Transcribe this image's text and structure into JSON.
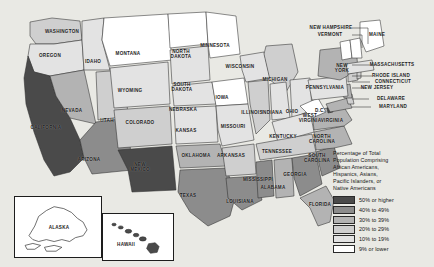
{
  "map": {
    "title": "United States minority population choropleth map",
    "background_color": "#e9e9e4",
    "border_color": "#1d1d1d"
  },
  "legend": {
    "title": "Percentage of Total\nPopulation Comprising\nAfrican Americans,\nHispanics, Asians,\nPacific Islanders, or\nNative Americans",
    "entries": [
      {
        "label": "50% or higher",
        "color": "#4a4a4a"
      },
      {
        "label": "40% to 49%",
        "color": "#8c8c8c"
      },
      {
        "label": "30% to 39%",
        "color": "#b3b3b3"
      },
      {
        "label": "20% to 29%",
        "color": "#cfcfcf"
      },
      {
        "label": "10% to 19%",
        "color": "#e3e3e3"
      },
      {
        "label": "9% or lower",
        "color": "#ffffff"
      }
    ]
  },
  "insets": {
    "alaska": {
      "label": "ALASKA",
      "fill": "#ffffff"
    },
    "hawaii": {
      "label": "HAWAII",
      "fill": "#4a4a4a"
    }
  },
  "chart_data": {
    "type": "choropleth",
    "title": "Percentage of Total Population Comprising African Americans, Hispanics, Asians, Pacific Islanders, or Native Americans",
    "bins": [
      {
        "label": "50% or higher",
        "color": "#4a4a4a"
      },
      {
        "label": "40% to 49%",
        "color": "#8c8c8c"
      },
      {
        "label": "30% to 39%",
        "color": "#b3b3b3"
      },
      {
        "label": "20% to 29%",
        "color": "#cfcfcf"
      },
      {
        "label": "10% to 19%",
        "color": "#e3e3e3"
      },
      {
        "label": "9% or lower",
        "color": "#ffffff"
      }
    ],
    "legend_position": "right",
    "states": [
      {
        "code": "WA",
        "name": "WASHINGTON",
        "bin": "20% to 29%",
        "color": "#cfcfcf",
        "label_x": 62,
        "label_y": 32,
        "label": "WASHINGTON"
      },
      {
        "code": "OR",
        "name": "OREGON",
        "bin": "10% to 19%",
        "color": "#e3e3e3",
        "label_x": 50,
        "label_y": 56,
        "label": "OREGON"
      },
      {
        "code": "ID",
        "name": "IDAHO",
        "bin": "10% to 19%",
        "color": "#e3e3e3",
        "label_x": 93,
        "label_y": 62,
        "label": "IDAHO"
      },
      {
        "code": "CA",
        "name": "CALIFORNIA",
        "bin": "50% or higher",
        "color": "#4a4a4a",
        "label_x": 46,
        "label_y": 128,
        "label": "CALIFORNIA"
      },
      {
        "code": "NV",
        "name": "NEVADA",
        "bin": "30% to 39%",
        "color": "#b3b3b3",
        "label_x": 72,
        "label_y": 111,
        "label": "NEVADA"
      },
      {
        "code": "UT",
        "name": "UTAH",
        "bin": "20% to 29%",
        "color": "#cfcfcf",
        "label_x": 107,
        "label_y": 121,
        "label": "UTAH"
      },
      {
        "code": "AZ",
        "name": "ARIZONA",
        "bin": "40% to 49%",
        "color": "#8c8c8c",
        "label_x": 89,
        "label_y": 160,
        "label": "ARIZONA"
      },
      {
        "code": "MT",
        "name": "MONTANA",
        "bin": "9% or lower",
        "color": "#ffffff",
        "label_x": 128,
        "label_y": 54,
        "label": "MONTANA"
      },
      {
        "code": "WY",
        "name": "WYOMING",
        "bin": "10% to 19%",
        "color": "#e3e3e3",
        "label_x": 130,
        "label_y": 91,
        "label": "WYOMING"
      },
      {
        "code": "CO",
        "name": "COLORADO",
        "bin": "20% to 29%",
        "color": "#cfcfcf",
        "label_x": 140,
        "label_y": 123,
        "label": "COLORADO"
      },
      {
        "code": "NM",
        "name": "NEW\nMEXICO",
        "bin": "50% or higher",
        "color": "#4a4a4a",
        "label_x": 140,
        "label_y": 167,
        "label": "NEW\nMEXICO"
      },
      {
        "code": "ND",
        "name": "NORTH\nDAKOTA",
        "bin": "9% or lower",
        "color": "#ffffff",
        "label_x": 181,
        "label_y": 54,
        "label": "NORTH\nDAKOTA"
      },
      {
        "code": "SD",
        "name": "SOUTH\nDAKOTA",
        "bin": "10% to 19%",
        "color": "#e3e3e3",
        "label_x": 182,
        "label_y": 87,
        "label": "SOUTH\nDAKOTA"
      },
      {
        "code": "NE",
        "name": "NEBRASKA",
        "bin": "10% to 19%",
        "color": "#e3e3e3",
        "label_x": 183,
        "label_y": 110,
        "label": "NEBRASKA"
      },
      {
        "code": "KS",
        "name": "KANSAS",
        "bin": "10% to 19%",
        "color": "#e3e3e3",
        "label_x": 186,
        "label_y": 131,
        "label": "KANSAS"
      },
      {
        "code": "OK",
        "name": "OKLAHOMA",
        "bin": "30% to 39%",
        "color": "#b3b3b3",
        "label_x": 196,
        "label_y": 156,
        "label": "OKLAHOMA"
      },
      {
        "code": "TX",
        "name": "TEXAS",
        "bin": "40% to 49%",
        "color": "#8c8c8c",
        "label_x": 188,
        "label_y": 196,
        "label": "TEXAS"
      },
      {
        "code": "MN",
        "name": "MINNESOTA",
        "bin": "9% or lower",
        "color": "#ffffff",
        "label_x": 215,
        "label_y": 46,
        "label": "MINNESOTA"
      },
      {
        "code": "IA",
        "name": "IOWA",
        "bin": "9% or lower",
        "color": "#ffffff",
        "label_x": 222,
        "label_y": 98,
        "label": "IOWA"
      },
      {
        "code": "MO",
        "name": "MISSOURI",
        "bin": "10% to 19%",
        "color": "#e3e3e3",
        "label_x": 233,
        "label_y": 127,
        "label": "MISSOURI"
      },
      {
        "code": "AR",
        "name": "ARKANSAS",
        "bin": "20% to 29%",
        "color": "#cfcfcf",
        "label_x": 231,
        "label_y": 156,
        "label": "ARKANSAS"
      },
      {
        "code": "LA",
        "name": "LOUISIANA",
        "bin": "40% to 49%",
        "color": "#8c8c8c",
        "label_x": 240,
        "label_y": 202,
        "label": "LOUISIANA"
      },
      {
        "code": "WI",
        "name": "WISCONSIN",
        "bin": "10% to 19%",
        "color": "#e3e3e3",
        "label_x": 240,
        "label_y": 67,
        "label": "WISCONSIN"
      },
      {
        "code": "IL",
        "name": "ILLINOIS",
        "bin": "20% to 29%",
        "color": "#cfcfcf",
        "label_x": 252,
        "label_y": 113,
        "label": "ILLINOIS"
      },
      {
        "code": "MI",
        "name": "MICHIGAN",
        "bin": "20% to 29%",
        "color": "#cfcfcf",
        "label_x": 275,
        "label_y": 80,
        "label": "MICHIGAN"
      },
      {
        "code": "IN",
        "name": "INDIANA",
        "bin": "10% to 19%",
        "color": "#e3e3e3",
        "label_x": 272,
        "label_y": 113,
        "label": "INDIANA"
      },
      {
        "code": "OH",
        "name": "OHIO",
        "bin": "10% to 19%",
        "color": "#e3e3e3",
        "label_x": 292,
        "label_y": 112,
        "label": "OHIO"
      },
      {
        "code": "KY",
        "name": "KENTUCKY",
        "bin": "10% to 19%",
        "color": "#e3e3e3",
        "label_x": 283,
        "label_y": 137,
        "label": "KENTUCKY"
      },
      {
        "code": "TN",
        "name": "TENNESSEE",
        "bin": "20% to 29%",
        "color": "#cfcfcf",
        "label_x": 277,
        "label_y": 152,
        "label": "TENNESSEE"
      },
      {
        "code": "MS",
        "name": "MISSISSIPPI",
        "bin": "40% to 49%",
        "color": "#8c8c8c",
        "label_x": 258,
        "label_y": 180,
        "label": "MISSISSIPPI"
      },
      {
        "code": "AL",
        "name": "ALABAMA",
        "bin": "30% to 39%",
        "color": "#b3b3b3",
        "label_x": 273,
        "label_y": 188,
        "label": "ALABAMA"
      },
      {
        "code": "GA",
        "name": "GEORGIA",
        "bin": "40% to 49%",
        "color": "#8c8c8c",
        "label_x": 295,
        "label_y": 175,
        "label": "GEORGIA"
      },
      {
        "code": "FL",
        "name": "FLORIDA",
        "bin": "30% to 39%",
        "color": "#b3b3b3",
        "label_x": 320,
        "label_y": 205,
        "label": "FLORIDA"
      },
      {
        "code": "SC",
        "name": "SOUTH\nCAROLINA",
        "bin": "40% to 49%",
        "color": "#8c8c8c",
        "label_x": 317,
        "label_y": 158,
        "label": "SOUTH\nCAROLINA"
      },
      {
        "code": "NC",
        "name": "NORTH\nCAROLINA",
        "bin": "30% to 39%",
        "color": "#b3b3b3",
        "label_x": 322,
        "label_y": 139,
        "label": "NORTH\nCAROLINA"
      },
      {
        "code": "VA",
        "name": "VIRGINIA",
        "bin": "30% to 39%",
        "color": "#b3b3b3",
        "label_x": 332,
        "label_y": 121,
        "label": "VIRGINIA"
      },
      {
        "code": "WV",
        "name": "WEST\nVIRGINIA",
        "bin": "9% or lower",
        "color": "#ffffff",
        "label_x": 310,
        "label_y": 118,
        "label": "WEST\nVIRGINIA"
      },
      {
        "code": "DC",
        "name": "D.C.",
        "bin": "50% or higher",
        "color": "#4a4a4a",
        "label_x": 320,
        "label_y": 111,
        "label": "D.C."
      },
      {
        "code": "MD",
        "name": "MARYLAND",
        "bin": "30% to 39%",
        "color": "#b3b3b3",
        "label_x": 393,
        "label_y": 107,
        "label": "MARYLAND"
      },
      {
        "code": "DE",
        "name": "DELAWARE",
        "bin": "20% to 29%",
        "color": "#cfcfcf",
        "label_x": 391,
        "label_y": 99,
        "label": "DELAWARE"
      },
      {
        "code": "NJ",
        "name": "NEW JERSEY",
        "bin": "30% to 39%",
        "color": "#b3b3b3",
        "label_x": 377,
        "label_y": 88,
        "label": "NEW JERSEY"
      },
      {
        "code": "PA",
        "name": "PENNSYLVANIA",
        "bin": "10% to 19%",
        "color": "#e3e3e3",
        "label_x": 325,
        "label_y": 88,
        "label": "PENNSYLVANIA"
      },
      {
        "code": "NY",
        "name": "NEW\nYORK",
        "bin": "30% to 39%",
        "color": "#b3b3b3",
        "label_x": 342,
        "label_y": 68,
        "label": "NEW\nYORK"
      },
      {
        "code": "CT",
        "name": "CONNECTICUT",
        "bin": "20% to 29%",
        "color": "#cfcfcf",
        "label_x": 393,
        "label_y": 82,
        "label": "CONNECTICUT"
      },
      {
        "code": "RI",
        "name": "RHODE ISLAND",
        "bin": "20% to 29%",
        "color": "#cfcfcf",
        "label_x": 391,
        "label_y": 76,
        "label": "RHODE ISLAND"
      },
      {
        "code": "MA",
        "name": "MASSACHUSETTS",
        "bin": "10% to 19%",
        "color": "#e3e3e3",
        "label_x": 392,
        "label_y": 65,
        "label": "MASSACHUSETTS"
      },
      {
        "code": "VT",
        "name": "VERMONT",
        "bin": "9% or lower",
        "color": "#ffffff",
        "label_x": 330,
        "label_y": 35,
        "label": "VERMONT"
      },
      {
        "code": "NH",
        "name": "NEW HAMPSHIRE",
        "bin": "9% or lower",
        "color": "#ffffff",
        "label_x": 331,
        "label_y": 28,
        "label": "NEW HAMPSHIRE"
      },
      {
        "code": "ME",
        "name": "MAINE",
        "bin": "9% or lower",
        "color": "#ffffff",
        "label_x": 377,
        "label_y": 35,
        "label": "MAINE"
      },
      {
        "code": "AK",
        "name": "ALASKA",
        "bin": "9% or lower",
        "color": "#ffffff",
        "label_x": 58,
        "label_y": 227,
        "label": "ALASKA"
      },
      {
        "code": "HI",
        "name": "HAWAII",
        "bin": "50% or higher",
        "color": "#4a4a4a",
        "label_x": 125,
        "label_y": 243,
        "label": "HAWAII"
      }
    ]
  }
}
